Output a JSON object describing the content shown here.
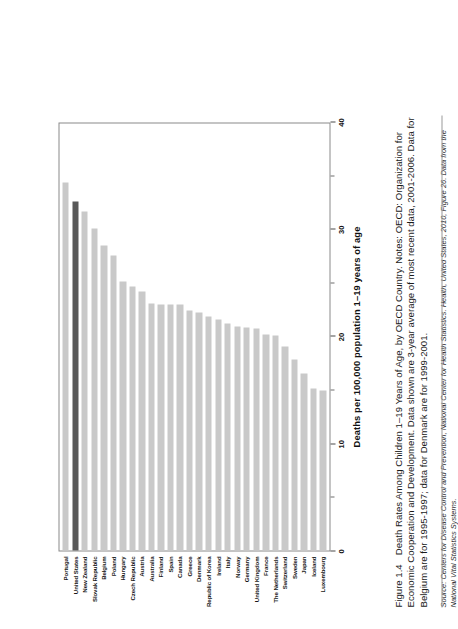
{
  "figure": {
    "number": "Figure 1.4",
    "caption": "Death Rates Among Children 1–19 Years of Age, by OECD Country. Notes: OECD: Organization for Economic Cooperation and Development. Data shown are 3-year average of most recent data, 2001-2006. Data for Belgium are for 1995-1997; data for Denmark are for 1999-2001.",
    "source": "Source: Centers for Disease Control and Prevention, National Center for Health Statistics. Health, United States, 2010, Figure 26. Data from the National Vital Statistics Systems."
  },
  "colors": {
    "bar": "#c9c9c9",
    "highlight_bar": "#595959",
    "frame": "#8a8a8a",
    "text": "#1a1a1a"
  },
  "chart_data": {
    "type": "bar",
    "orientation": "horizontal",
    "title": "",
    "xlabel": "Deaths per 100,000 population 1–19 years of age",
    "ylabel": "",
    "xlim": [
      0,
      40
    ],
    "xticks": [
      0,
      10,
      20,
      30,
      40
    ],
    "xtick_labels": [
      "0",
      "10",
      "20",
      "30",
      "40"
    ],
    "minor_ticks": [
      5,
      15,
      25,
      35
    ],
    "grid": false,
    "legend": "none",
    "highlight_category": "United States",
    "categories": [
      "Portugal",
      "United States",
      "New Zealand",
      "Slovak Republic",
      "Belgium",
      "Poland",
      "Hungary",
      "Czech Republic",
      "Austria",
      "Australia",
      "Finland",
      "Spain",
      "Canada",
      "Greece",
      "Denmark",
      "Republic of Korea",
      "Ireland",
      "Italy",
      "Norway",
      "Germany",
      "United Kingdom",
      "France",
      "The Netherlands",
      "Switzerland",
      "Sweden",
      "Japan",
      "Iceland",
      "Luxembourg"
    ],
    "values": [
      34.5,
      32.7,
      31.8,
      30.2,
      28.6,
      27.6,
      25.2,
      24.7,
      24.3,
      23.1,
      23.0,
      23.0,
      23.0,
      22.5,
      22.3,
      21.9,
      21.6,
      21.3,
      21.0,
      20.9,
      20.8,
      20.2,
      20.1,
      19.1,
      17.9,
      16.6,
      15.2,
      15.0
    ]
  }
}
